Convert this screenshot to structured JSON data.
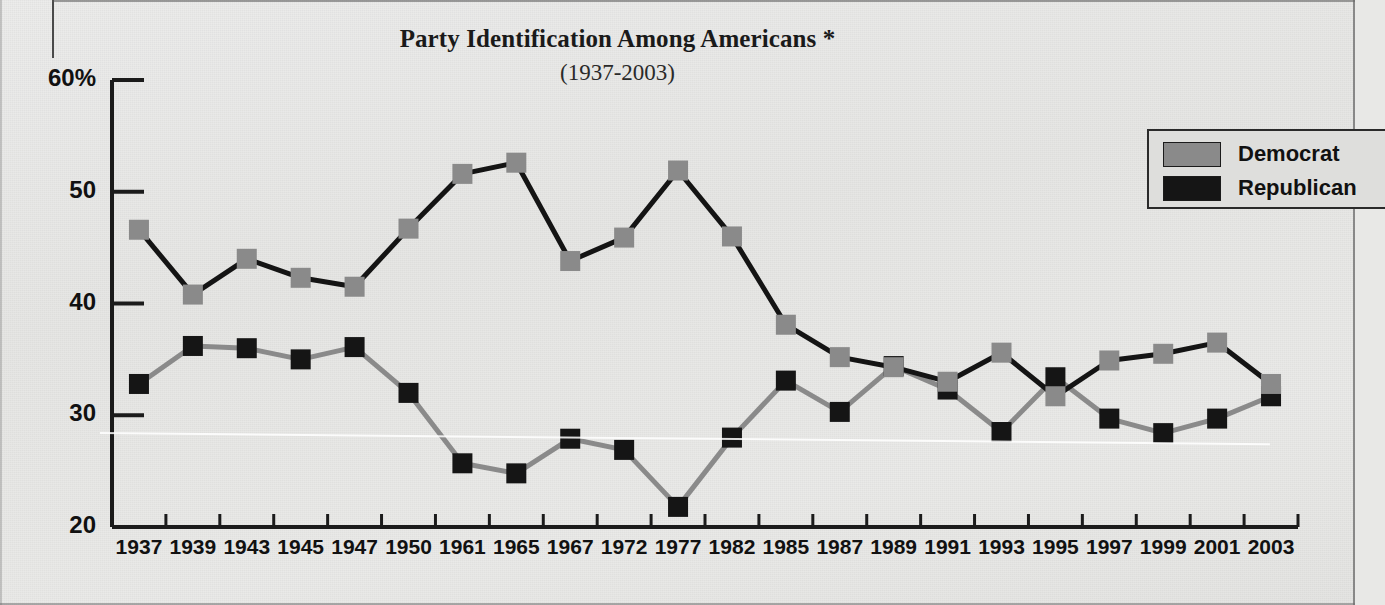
{
  "chart_data": {
    "type": "line",
    "title": "Party Identification Among Americans *",
    "subtitle": "(1937-2003)",
    "xlabel": "",
    "ylabel": "",
    "ylim": [
      20,
      60
    ],
    "yticks": [
      "20",
      "30",
      "40",
      "50",
      "60%"
    ],
    "ytick_values": [
      20,
      30,
      40,
      50,
      60
    ],
    "grid": false,
    "legend_position": "top-right",
    "categories": [
      "1937",
      "1939",
      "1943",
      "1945",
      "1947",
      "1950",
      "1961",
      "1965",
      "1967",
      "1972",
      "1977",
      "1982",
      "1985",
      "1987",
      "1989",
      "1991",
      "1993",
      "1995",
      "1997",
      "1999",
      "2001",
      "2003"
    ],
    "series": [
      {
        "name": "Democrat",
        "marker_color": "#8a8a8a",
        "line_color": "#141414",
        "values": [
          46.6,
          40.8,
          44.0,
          42.3,
          41.5,
          46.7,
          51.6,
          52.6,
          43.8,
          45.9,
          51.9,
          46.0,
          38.1,
          35.2,
          34.3,
          33.0,
          35.6,
          31.7,
          34.9,
          35.5,
          36.5,
          32.8
        ]
      },
      {
        "name": "Republican",
        "marker_color": "#151515",
        "line_color": "#8a8a8a",
        "values": [
          32.8,
          36.2,
          36.0,
          35.0,
          36.1,
          32.0,
          25.7,
          24.8,
          27.9,
          26.9,
          21.8,
          28.0,
          33.1,
          30.3,
          34.4,
          32.3,
          28.5,
          33.4,
          29.7,
          28.4,
          29.7,
          31.7
        ]
      }
    ]
  },
  "legend": {
    "items": [
      {
        "label": "Democrat",
        "color": "#8a8a8a"
      },
      {
        "label": "Republican",
        "color": "#151515"
      }
    ]
  }
}
